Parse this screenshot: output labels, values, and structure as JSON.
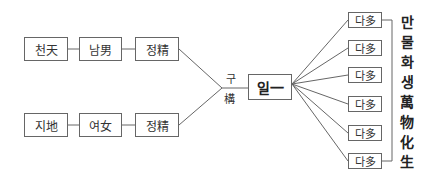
{
  "top_row": [
    "천天",
    "남男",
    "정精"
  ],
  "bottom_row": [
    "지地",
    "여女",
    "정精"
  ],
  "join_label": [
    "구",
    "構"
  ],
  "center": "일一",
  "outputs": [
    "다多",
    "다多",
    "다多",
    "다多",
    "다多",
    "다多"
  ],
  "side_label": [
    "만",
    "물",
    "화",
    "생",
    "萬",
    "物",
    "化",
    "生"
  ]
}
